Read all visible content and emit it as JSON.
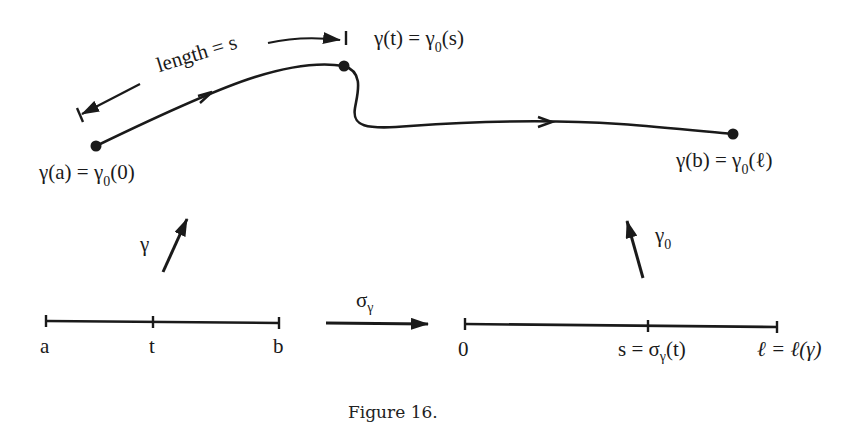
{
  "figure": {
    "caption": "Figure 16.",
    "colors": {
      "ink": "#1a1a1a",
      "background": "#ffffff"
    }
  },
  "curve": {
    "start_point": {
      "lhs": "γ(a) = γ",
      "sub": "0",
      "rhs": "(0)"
    },
    "mid_point": {
      "lhs": "γ(t) = γ",
      "sub": "0",
      "rhs": "(s)"
    },
    "end_point": {
      "lhs": "γ(b) = γ",
      "sub": "0",
      "rhs": "(ℓ)"
    },
    "length_annotation": "length = s"
  },
  "maps": {
    "gamma": {
      "symbol": "γ"
    },
    "gamma0": {
      "symbol": "γ",
      "sub": "0"
    },
    "sigma": {
      "symbol": "σ",
      "sub": "γ"
    }
  },
  "left_interval": {
    "ticks": [
      {
        "label": "a"
      },
      {
        "label": "t"
      },
      {
        "label": "b"
      }
    ]
  },
  "right_interval": {
    "ticks": [
      {
        "label": "0"
      },
      {
        "label_main": "s = σ",
        "label_sub": "γ",
        "label_end": "(t)"
      },
      {
        "label": "ℓ = ℓ(γ)"
      }
    ]
  }
}
